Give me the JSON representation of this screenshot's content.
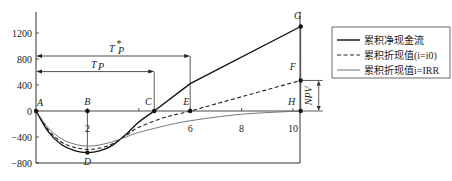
{
  "chart_data": {
    "type": "line",
    "title": "",
    "xlabel": "",
    "ylabel": "",
    "xlim": [
      0,
      10.3
    ],
    "ylim": [
      -850,
      1350
    ],
    "x_ticks": [
      2,
      4,
      6,
      8,
      10
    ],
    "x_tick_labels": [
      "2",
      "6",
      "8",
      "10"
    ],
    "x_tick_label_values": [
      2,
      6,
      8,
      10
    ],
    "y_ticks": [
      -800,
      -400,
      0,
      400,
      800,
      1200
    ],
    "y_tick_labels": [
      "−800",
      "−400",
      "0",
      "400",
      "800",
      "1200"
    ],
    "grid": false,
    "legend_position": "right",
    "series": [
      {
        "name": "累积净现金流",
        "style": "solid-thick",
        "x": [
          0,
          0.5,
          1,
          1.5,
          2,
          2.5,
          3,
          3.5,
          4,
          4.6,
          6,
          10.3
        ],
        "values": [
          0,
          -330,
          -520,
          -610,
          -640,
          -610,
          -520,
          -360,
          -170,
          0,
          420,
          1300
        ]
      },
      {
        "name": "累积折现值(i=i0)",
        "style": "dashed",
        "x": [
          0,
          0.5,
          1,
          1.5,
          2,
          2.5,
          3,
          3.5,
          4,
          5,
          6,
          8,
          10.3
        ],
        "values": [
          0,
          -300,
          -480,
          -560,
          -590,
          -570,
          -500,
          -380,
          -250,
          -100,
          0,
          220,
          470
        ]
      },
      {
        "name": "累积折现值i=IRR",
        "style": "solid-thin",
        "x": [
          0,
          0.5,
          1,
          1.5,
          2,
          2.5,
          3,
          3.5,
          4,
          5,
          6,
          8,
          10.3
        ],
        "values": [
          0,
          -270,
          -430,
          -510,
          -540,
          -520,
          -470,
          -400,
          -330,
          -230,
          -150,
          -50,
          0
        ]
      }
    ],
    "points": [
      {
        "label": "A",
        "x": 0,
        "y": 0
      },
      {
        "label": "B",
        "x": 2,
        "y": 0
      },
      {
        "label": "C",
        "x": 4.6,
        "y": 0
      },
      {
        "label": "E",
        "x": 6,
        "y": 0
      },
      {
        "label": "H",
        "x": 10.3,
        "y": 0
      },
      {
        "label": "G",
        "x": 10.3,
        "y": 1300
      },
      {
        "label": "F",
        "x": 10.3,
        "y": 470
      },
      {
        "label": "D",
        "x": 2,
        "y": -640
      }
    ],
    "annotations": [
      {
        "text": "T'p",
        "type": "span-arrow",
        "from_x": 0,
        "to_x": 6,
        "y": 800
      },
      {
        "text": "Tp",
        "type": "span-arrow",
        "from_x": 0,
        "to_x": 4.6,
        "y": 560
      },
      {
        "text": "NPV",
        "type": "bracket",
        "from_y": 0,
        "to_y": 470,
        "x": 10.3
      }
    ],
    "legend": [
      "累积净现金流",
      "累积折现值(i=i0)",
      "累积折现值i=IRR"
    ]
  },
  "labels": {
    "tp_prime": "T",
    "tp_prime_sup": "*",
    "tp_prime_sub": "P",
    "tp": "T",
    "tp_sub": "P",
    "npv": "NPV"
  }
}
